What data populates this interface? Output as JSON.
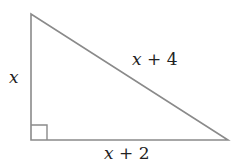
{
  "diagram": {
    "type": "right-triangle",
    "labels": {
      "vertical_leg": "x",
      "hypotenuse": "x + 4",
      "horizontal_leg": "x + 2"
    },
    "right_angle_marker": true,
    "colors": {
      "stroke": "#8a8a8a",
      "text": "#222222",
      "background": "#ffffff"
    }
  }
}
